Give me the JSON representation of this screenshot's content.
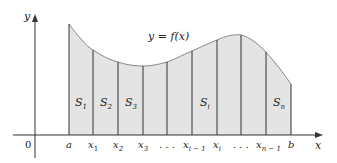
{
  "diagram": {
    "curve_label": "y = f(x)",
    "axes": {
      "x_label": "x",
      "y_label": "y",
      "origin_label": "0"
    },
    "fill_color": "#e4e4e4",
    "line_color": "#333333",
    "curve_color": "#888888",
    "partition_points": [
      {
        "label": "a",
        "sub": ""
      },
      {
        "label": "x",
        "sub": "1"
      },
      {
        "label": "x",
        "sub": "2"
      },
      {
        "label": "x",
        "sub": "3"
      },
      {
        "label": ". . .",
        "sub": ""
      },
      {
        "label": "x",
        "sub": "i − 1"
      },
      {
        "label": "x",
        "sub": "i"
      },
      {
        "label": ". . .",
        "sub": ""
      },
      {
        "label": "x",
        "sub": "n − 1"
      },
      {
        "label": "b",
        "sub": ""
      }
    ],
    "strip_labels": [
      {
        "label": "S",
        "sub": "1"
      },
      {
        "label": "S",
        "sub": "2"
      },
      {
        "label": "S",
        "sub": "3"
      },
      {
        "label": "S",
        "sub": "i"
      },
      {
        "label": "S",
        "sub": "n"
      }
    ]
  }
}
